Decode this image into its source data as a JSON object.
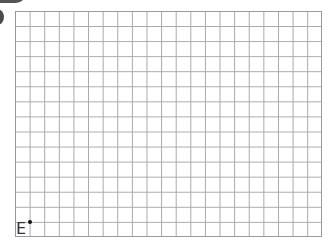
{
  "grid": {
    "columns": 21,
    "rows": 15,
    "line_color": "#a8a8a8"
  },
  "point": {
    "label": "E",
    "color": "#111111"
  }
}
